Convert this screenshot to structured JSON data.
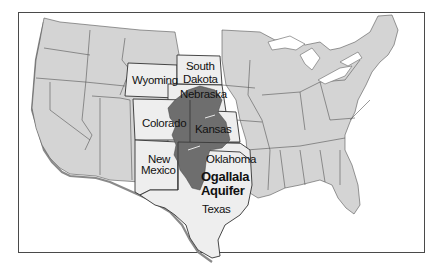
{
  "map": {
    "title": "Ogallala Aquifer",
    "region": "United States (contiguous)",
    "colors": {
      "other_states": "#d4d4d4",
      "highlighted_states": "#eeeeee",
      "aquifer": "#6e6e6e",
      "frame": "#4a4a4a"
    },
    "labels": {
      "wyoming": "Wyoming",
      "south_dakota_1": "South",
      "south_dakota_2": "Dakota",
      "nebraska": "Nebraska",
      "colorado": "Colorado",
      "kansas": "Kansas",
      "new_mexico_1": "New",
      "new_mexico_2": "Mexico",
      "oklahoma": "Oklahoma",
      "aquifer_1": "Ogallala",
      "aquifer_2": "Aquifer",
      "texas": "Texas"
    },
    "highlighted_states": [
      "Wyoming",
      "South Dakota",
      "Nebraska",
      "Colorado",
      "Kansas",
      "New Mexico",
      "Oklahoma",
      "Texas"
    ]
  }
}
